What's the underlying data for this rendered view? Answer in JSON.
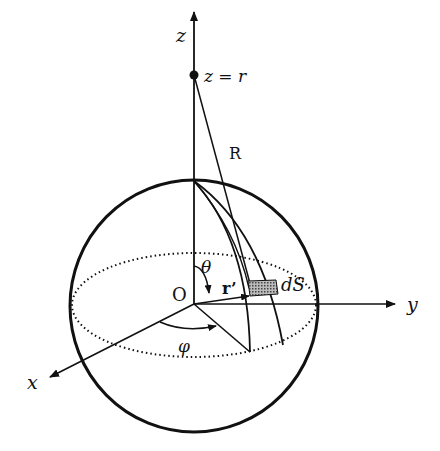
{
  "diagram": {
    "colors": {
      "stroke": "#111111",
      "background": "#ffffff",
      "patch": "#7a7a7a"
    },
    "labels": {
      "z_axis": "z",
      "y_axis": "y",
      "x_axis": "x",
      "point": "z = r",
      "distance": "R",
      "origin": "O",
      "polar_angle": "θ",
      "azimuth_angle": "φ",
      "position_vector": "r’",
      "surface_element": "dS"
    }
  }
}
